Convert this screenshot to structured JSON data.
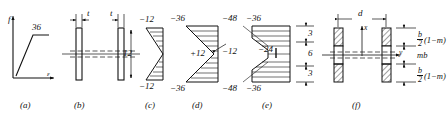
{
  "figure": {
    "panels": [
      {
        "key": "a",
        "caption": "(a)",
        "type": "stress-strain-curve",
        "axis_y_label": "f",
        "axis_x_label": "ε",
        "plateau_value": "36"
      },
      {
        "key": "b",
        "caption": "(b)",
        "type": "section-two-flanges",
        "dim_labels": [
          "t",
          "t"
        ]
      },
      {
        "key": "c",
        "caption": "(c)",
        "type": "linear-stress-distribution",
        "top_value": "−12",
        "bottom_value": "−12",
        "depth_dim": "12"
      },
      {
        "key": "d",
        "caption": "(d)",
        "type": "partial-yield-distribution",
        "top_value": "−36",
        "mid_value": "+12",
        "bottom_value": "−36"
      },
      {
        "key": "e",
        "caption": "(e)",
        "type": "full-yield-distribution",
        "top_outer": "−48",
        "top_inner": "−36",
        "left_mid": "−12",
        "mid_value": "−24",
        "bottom_outer": "−48",
        "bottom_inner": "−36",
        "dims": [
          "3",
          "6",
          "3"
        ]
      },
      {
        "key": "f",
        "caption": "(f)",
        "type": "idealized-section",
        "width_dim": "d",
        "axis_x_label": "x",
        "axis_y_label": "y",
        "top_label_num": "b",
        "top_label_den": "2",
        "top_label_rest": "(1−m)",
        "mid_label": "mb",
        "bot_label_num": "b",
        "bot_label_den": "2",
        "bot_label_rest": "(1−m)"
      }
    ]
  },
  "colors": {
    "ink": "#111111",
    "paper": "#ffffff"
  }
}
